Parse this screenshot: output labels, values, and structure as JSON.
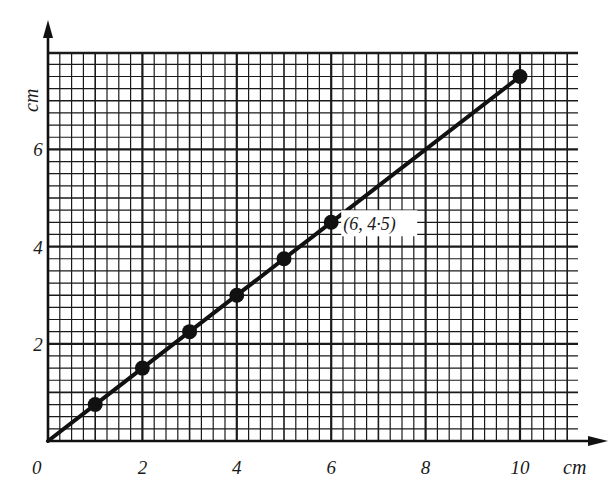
{
  "chart_data": {
    "type": "line",
    "title": "",
    "xlabel": "cm",
    "ylabel": "cm",
    "xlim": [
      0,
      11.2
    ],
    "ylim": [
      0,
      8
    ],
    "grid": true,
    "grid_minor_step": 0.25,
    "grid_major_step": 2,
    "x_ticks": [
      "0",
      "2",
      "4",
      "6",
      "8",
      "10"
    ],
    "y_ticks": [
      "2",
      "4",
      "6"
    ],
    "origin_label": "0",
    "series": [
      {
        "name": "line",
        "x": [
          0,
          1,
          2,
          3,
          4,
          5,
          6,
          10
        ],
        "y": [
          0,
          0.75,
          1.5,
          2.25,
          3,
          3.75,
          4.5,
          7.5
        ],
        "markers_at": [
          1,
          2,
          3,
          4,
          5,
          6,
          10
        ]
      }
    ],
    "annotations": [
      {
        "text": "(6, 4·5)",
        "x": 6,
        "y": 4.5
      }
    ],
    "colors": {
      "line": "#111111",
      "grid": "#1a1a1a",
      "background": "#ffffff"
    }
  }
}
